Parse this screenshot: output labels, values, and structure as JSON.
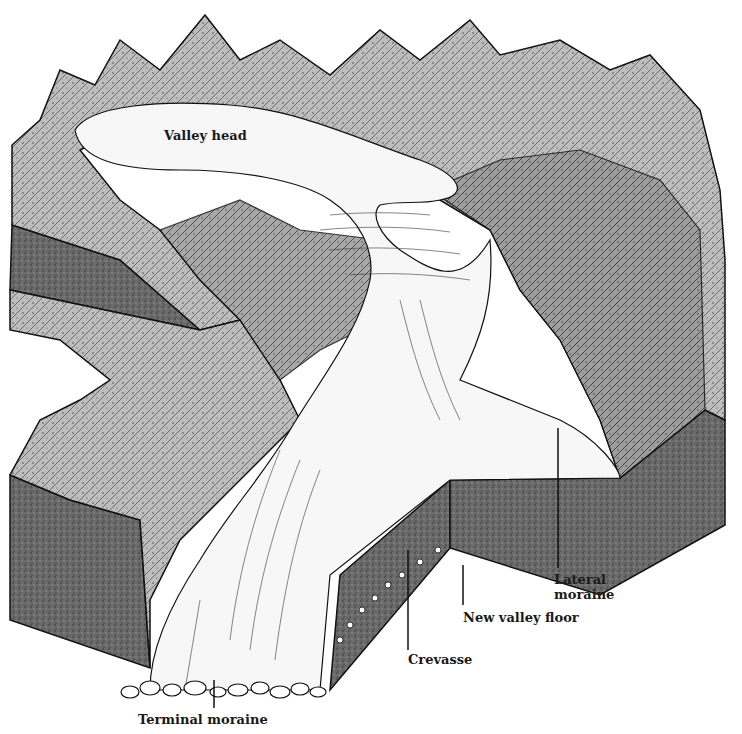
{
  "diagram": {
    "labels": {
      "valley_head": "Valley head",
      "lateral_moraine_line1": "Lateral",
      "lateral_moraine_line2": "moraine",
      "new_valley_floor": "New valley floor",
      "crevasse": "Crevasse",
      "terminal_moraine": "Terminal moraine"
    },
    "colors": {
      "background": "#ffffff",
      "ink": "#1a1a1a",
      "rock_shade": "#8a8a8a",
      "block_side": "#5a5a5a",
      "ice": "#f7f7f7"
    }
  }
}
